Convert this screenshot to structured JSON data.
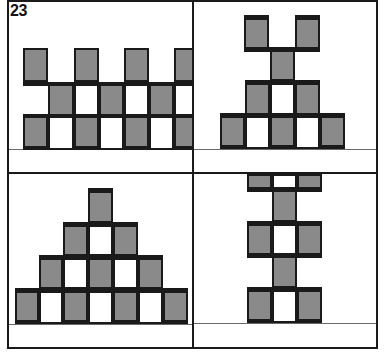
{
  "figure": {
    "number_label": "23",
    "colors": {
      "cell_fill": "#8a8a8a",
      "outline": "#1a1a1a",
      "background": "#ffffff",
      "baseline": "#6a6a6a"
    },
    "cell_size": 25,
    "panels": [
      {
        "id": "top-left",
        "description": "repeating checkered band, three rows",
        "origin": [
          8,
          1
        ],
        "cells": [
          {
            "x": 15,
            "y": 47,
            "w": 25,
            "h": 34,
            "fill": true
          },
          {
            "x": 66,
            "y": 47,
            "w": 25,
            "h": 34,
            "fill": true
          },
          {
            "x": 116,
            "y": 47,
            "w": 25,
            "h": 34,
            "fill": true
          },
          {
            "x": 166,
            "y": 47,
            "w": 25,
            "h": 34,
            "fill": true
          },
          {
            "x": 40,
            "y": 81,
            "w": 26,
            "h": 34,
            "fill": true
          },
          {
            "x": 66,
            "y": 81,
            "w": 25,
            "h": 34,
            "fill": false
          },
          {
            "x": 91,
            "y": 81,
            "w": 25,
            "h": 34,
            "fill": true
          },
          {
            "x": 116,
            "y": 81,
            "w": 25,
            "h": 34,
            "fill": false
          },
          {
            "x": 141,
            "y": 81,
            "w": 25,
            "h": 34,
            "fill": true
          },
          {
            "x": 166,
            "y": 81,
            "w": 25,
            "h": 34,
            "fill": false
          },
          {
            "x": 15,
            "y": 115,
            "w": 25,
            "h": 34,
            "fill": true
          },
          {
            "x": 40,
            "y": 115,
            "w": 26,
            "h": 34,
            "fill": false
          },
          {
            "x": 66,
            "y": 115,
            "w": 25,
            "h": 34,
            "fill": true
          },
          {
            "x": 91,
            "y": 115,
            "w": 25,
            "h": 34,
            "fill": false
          },
          {
            "x": 116,
            "y": 115,
            "w": 25,
            "h": 34,
            "fill": true
          },
          {
            "x": 141,
            "y": 115,
            "w": 25,
            "h": 34,
            "fill": false
          },
          {
            "x": 166,
            "y": 115,
            "w": 25,
            "h": 34,
            "fill": true
          }
        ],
        "bars": [
          {
            "x": 15,
            "y": 81,
            "w": 176,
            "h": 4
          },
          {
            "x": 15,
            "y": 113,
            "w": 176,
            "h": 4
          }
        ],
        "baseline_y": 148
      },
      {
        "id": "top-right",
        "description": "inverted pyramid topped by two posts",
        "origin": [
          194,
          1
        ],
        "cells": [
          {
            "x": 50,
            "y": 14,
            "w": 25,
            "h": 36,
            "fill": true
          },
          {
            "x": 101,
            "y": 14,
            "w": 25,
            "h": 36,
            "fill": true
          },
          {
            "x": 76,
            "y": 47,
            "w": 25,
            "h": 33,
            "fill": true
          },
          {
            "x": 51,
            "y": 80,
            "w": 25,
            "h": 34,
            "fill": true
          },
          {
            "x": 76,
            "y": 80,
            "w": 25,
            "h": 34,
            "fill": false
          },
          {
            "x": 101,
            "y": 80,
            "w": 25,
            "h": 34,
            "fill": true
          },
          {
            "x": 26,
            "y": 113,
            "w": 25,
            "h": 35,
            "fill": true
          },
          {
            "x": 51,
            "y": 113,
            "w": 25,
            "h": 35,
            "fill": false
          },
          {
            "x": 76,
            "y": 113,
            "w": 25,
            "h": 35,
            "fill": true
          },
          {
            "x": 101,
            "y": 113,
            "w": 25,
            "h": 35,
            "fill": false
          },
          {
            "x": 126,
            "y": 113,
            "w": 25,
            "h": 35,
            "fill": true
          }
        ],
        "bars": [
          {
            "x": 50,
            "y": 14,
            "w": 25,
            "h": 5
          },
          {
            "x": 101,
            "y": 14,
            "w": 25,
            "h": 5
          },
          {
            "x": 50,
            "y": 46,
            "w": 76,
            "h": 5
          },
          {
            "x": 51,
            "y": 79,
            "w": 75,
            "h": 5
          },
          {
            "x": 26,
            "y": 112,
            "w": 125,
            "h": 5
          }
        ],
        "baseline_y": 148
      },
      {
        "id": "bottom-left",
        "description": "stepped pyramid, four tiers",
        "origin": [
          8,
          174
        ],
        "cells": [
          {
            "x": 80,
            "y": 14,
            "w": 25,
            "h": 35,
            "fill": true
          },
          {
            "x": 55,
            "y": 49,
            "w": 25,
            "h": 33,
            "fill": true
          },
          {
            "x": 80,
            "y": 49,
            "w": 25,
            "h": 33,
            "fill": false
          },
          {
            "x": 105,
            "y": 49,
            "w": 25,
            "h": 33,
            "fill": true
          },
          {
            "x": 31,
            "y": 82,
            "w": 24,
            "h": 33,
            "fill": true
          },
          {
            "x": 55,
            "y": 82,
            "w": 25,
            "h": 33,
            "fill": false
          },
          {
            "x": 80,
            "y": 82,
            "w": 25,
            "h": 33,
            "fill": true
          },
          {
            "x": 105,
            "y": 82,
            "w": 25,
            "h": 33,
            "fill": false
          },
          {
            "x": 130,
            "y": 82,
            "w": 25,
            "h": 33,
            "fill": true
          },
          {
            "x": 7,
            "y": 115,
            "w": 24,
            "h": 35,
            "fill": true
          },
          {
            "x": 31,
            "y": 115,
            "w": 24,
            "h": 35,
            "fill": false
          },
          {
            "x": 55,
            "y": 115,
            "w": 25,
            "h": 35,
            "fill": true
          },
          {
            "x": 80,
            "y": 115,
            "w": 25,
            "h": 35,
            "fill": false
          },
          {
            "x": 105,
            "y": 115,
            "w": 25,
            "h": 35,
            "fill": true
          },
          {
            "x": 130,
            "y": 115,
            "w": 25,
            "h": 35,
            "fill": false
          },
          {
            "x": 155,
            "y": 115,
            "w": 25,
            "h": 35,
            "fill": true
          }
        ],
        "bars": [
          {
            "x": 80,
            "y": 14,
            "w": 25,
            "h": 5
          },
          {
            "x": 55,
            "y": 48,
            "w": 75,
            "h": 5
          },
          {
            "x": 31,
            "y": 81,
            "w": 124,
            "h": 5
          },
          {
            "x": 7,
            "y": 114,
            "w": 173,
            "h": 5
          }
        ],
        "baseline_y": 150
      },
      {
        "id": "bottom-right",
        "description": "vertical stack alternating pairs and single posts",
        "origin": [
          194,
          174
        ],
        "cells": [
          {
            "x": 53,
            "y": 0,
            "w": 25,
            "h": 15,
            "fill": true
          },
          {
            "x": 78,
            "y": 0,
            "w": 25,
            "h": 15,
            "fill": false
          },
          {
            "x": 103,
            "y": 0,
            "w": 25,
            "h": 15,
            "fill": true
          },
          {
            "x": 78,
            "y": 15,
            "w": 25,
            "h": 33,
            "fill": true
          },
          {
            "x": 53,
            "y": 48,
            "w": 25,
            "h": 33,
            "fill": true
          },
          {
            "x": 78,
            "y": 48,
            "w": 25,
            "h": 33,
            "fill": false
          },
          {
            "x": 103,
            "y": 48,
            "w": 25,
            "h": 33,
            "fill": true
          },
          {
            "x": 78,
            "y": 81,
            "w": 25,
            "h": 33,
            "fill": true
          },
          {
            "x": 53,
            "y": 114,
            "w": 25,
            "h": 35,
            "fill": true
          },
          {
            "x": 78,
            "y": 114,
            "w": 25,
            "h": 35,
            "fill": false
          },
          {
            "x": 103,
            "y": 114,
            "w": 25,
            "h": 35,
            "fill": true
          }
        ],
        "bars": [
          {
            "x": 53,
            "y": 13,
            "w": 75,
            "h": 5
          },
          {
            "x": 53,
            "y": 47,
            "w": 75,
            "h": 5
          },
          {
            "x": 53,
            "y": 79,
            "w": 75,
            "h": 5
          },
          {
            "x": 53,
            "y": 113,
            "w": 75,
            "h": 5
          }
        ],
        "baseline_y": 149
      }
    ]
  }
}
